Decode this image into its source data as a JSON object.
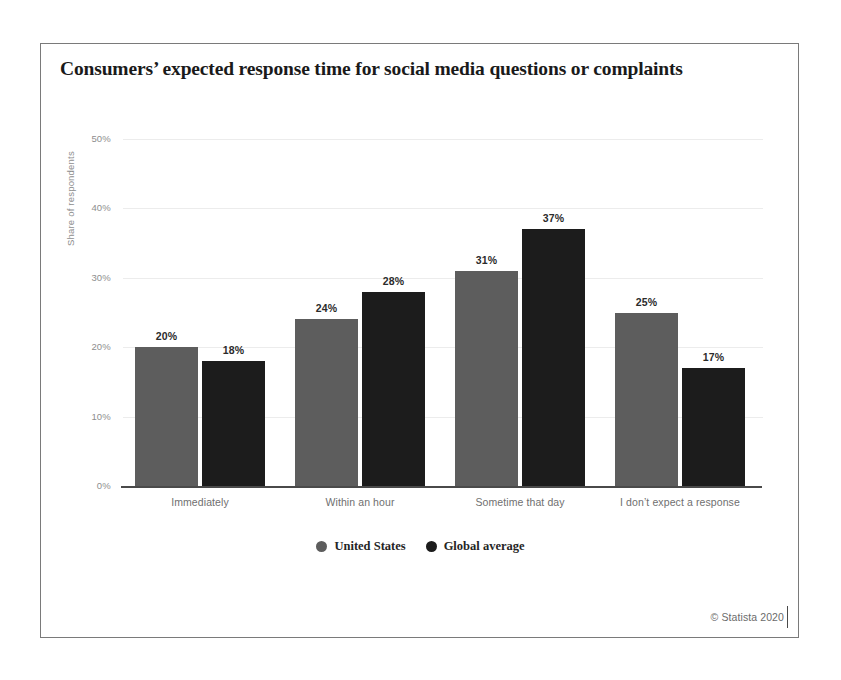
{
  "chart_data": {
    "type": "bar",
    "title": "Consumers’ expected response time for social media questions or complaints",
    "xlabel": "",
    "ylabel": "Share of respondents",
    "ylim": [
      0,
      50
    ],
    "grid": true,
    "legend_position": "bottom-center",
    "categories": [
      "Immediately",
      "Within an hour",
      "Sometime that day",
      "I don’t expect a response"
    ],
    "ytick_labels": [
      "0%",
      "10%",
      "20%",
      "30%",
      "40%",
      "50%"
    ],
    "ytick_values": [
      0,
      10,
      20,
      30,
      40,
      50
    ],
    "series": [
      {
        "name": "United States",
        "color": "#5d5d5d",
        "values": [
          20,
          24,
          31,
          25
        ],
        "value_labels": [
          "20%",
          "24%",
          "31%",
          "25%"
        ]
      },
      {
        "name": "Global average",
        "color": "#1c1c1c",
        "values": [
          18,
          28,
          37,
          17
        ],
        "value_labels": [
          "18%",
          "28%",
          "37%",
          "17%"
        ]
      }
    ]
  },
  "footer": {
    "credit": "© Statista 2020"
  }
}
